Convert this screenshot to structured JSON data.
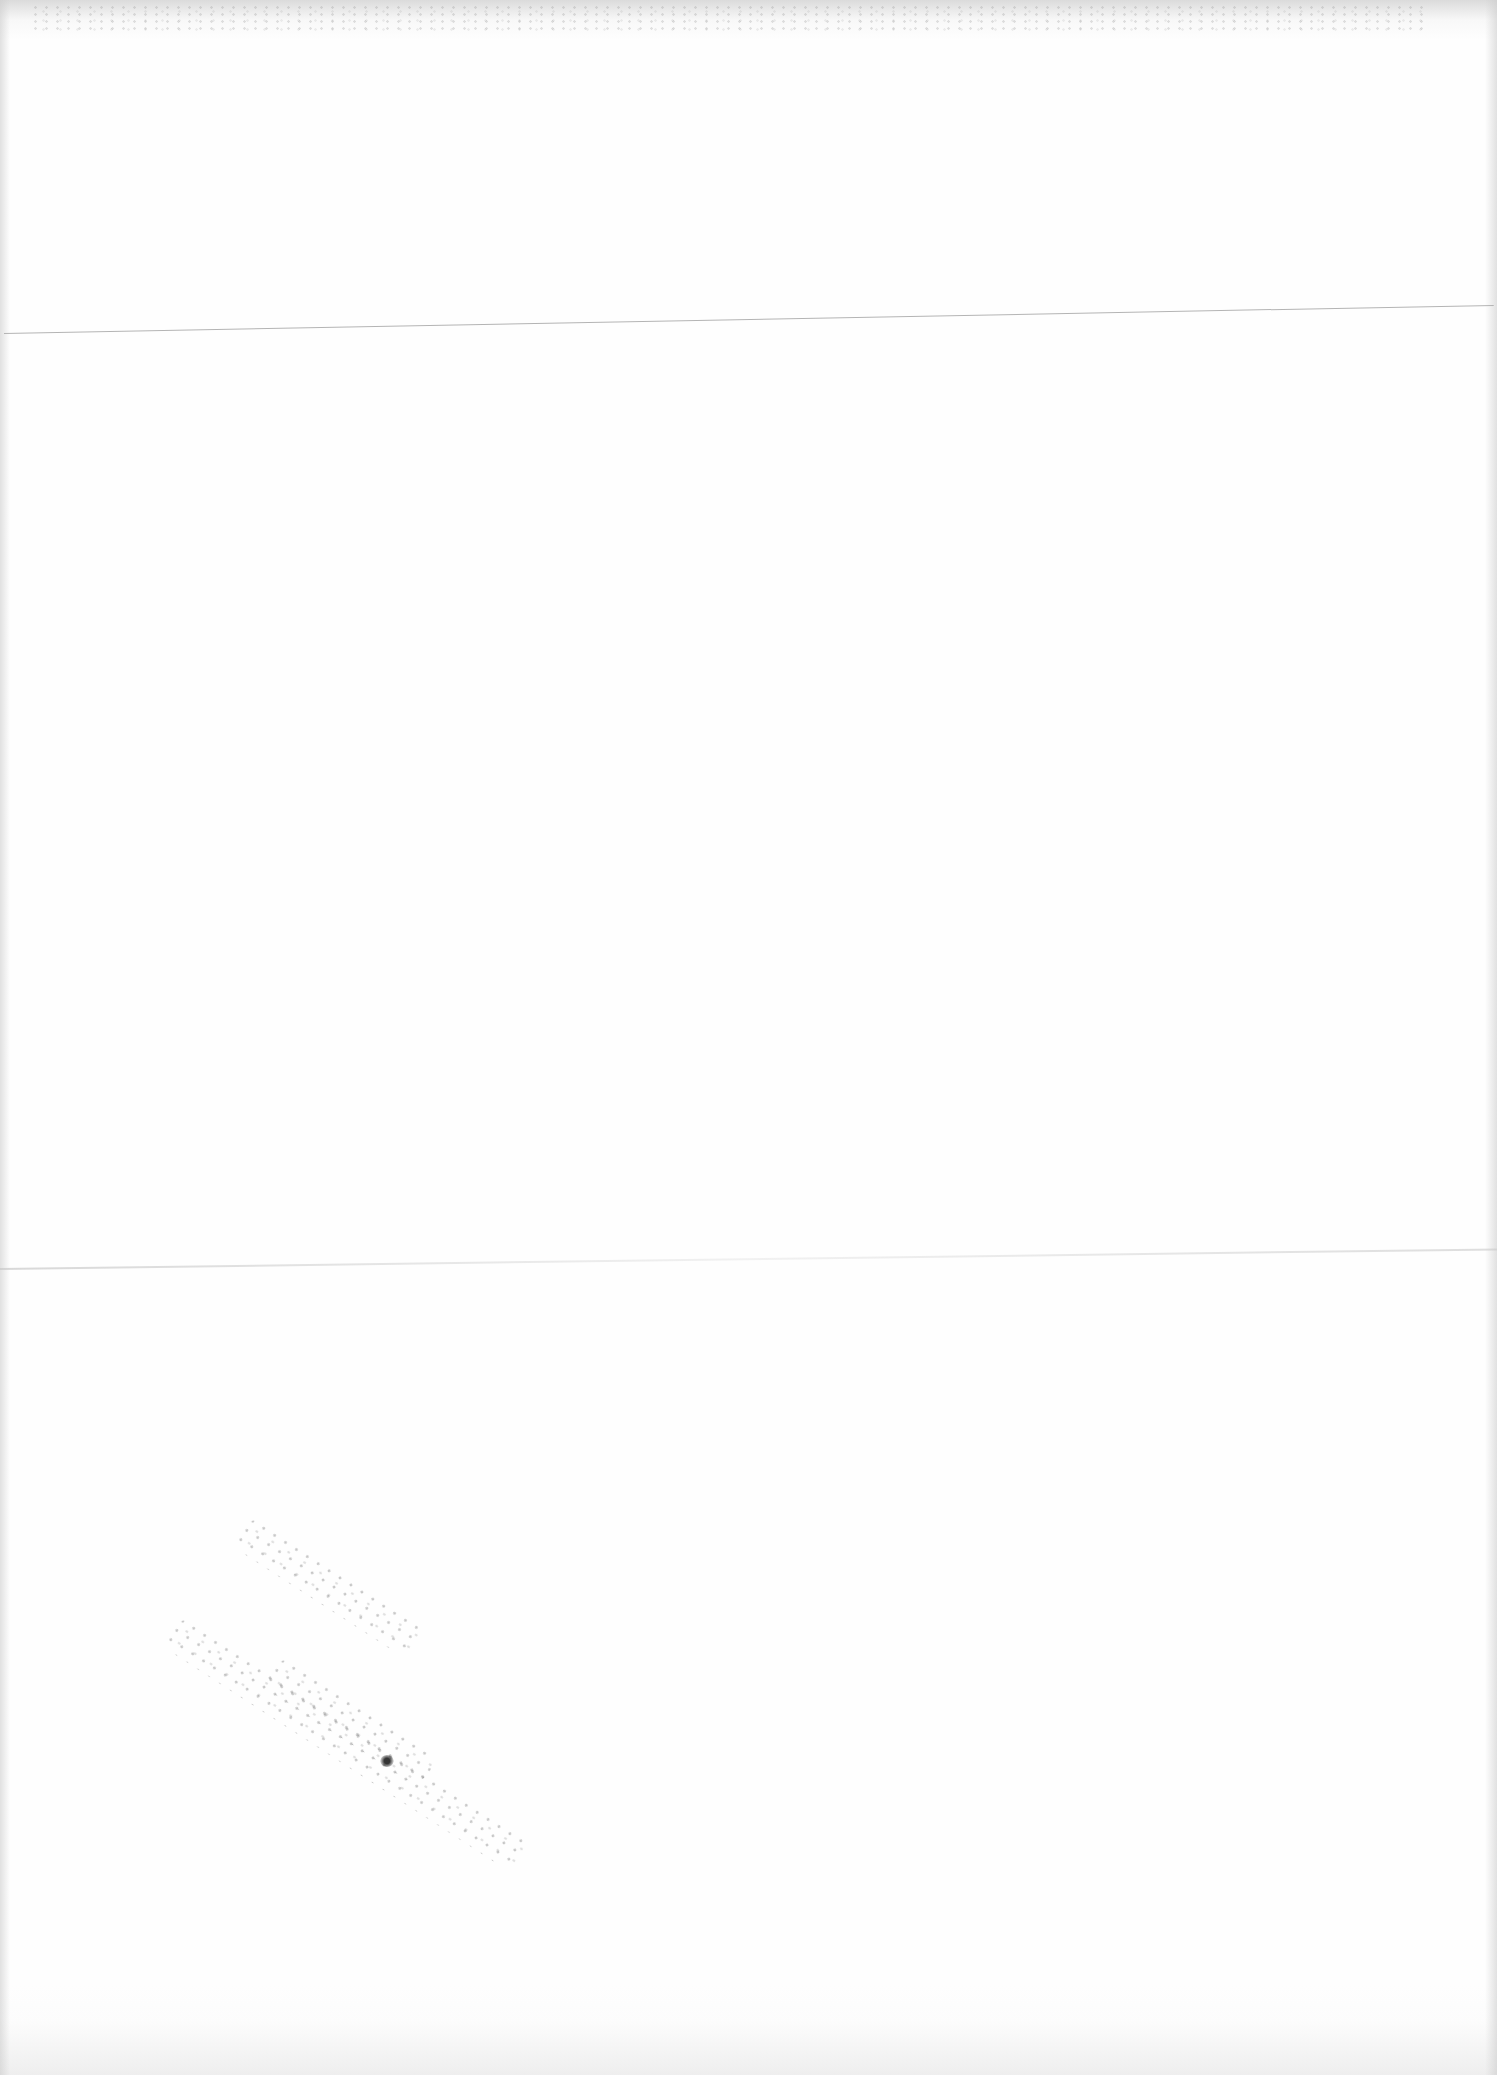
{
  "page": {
    "description": "Blank scanned page",
    "background_color": "#fefefe",
    "text_content": ""
  },
  "artifacts": {
    "top_rule": {
      "label": "Horizontal rule",
      "color": "#b4b4b4"
    },
    "fold_line": {
      "label": "Paper fold"
    },
    "smudge": {
      "label": "Speckle smudge"
    },
    "scan_noise": {
      "label": "Scanner edge noise"
    }
  }
}
